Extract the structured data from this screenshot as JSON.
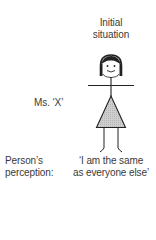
{
  "title": {
    "line1": "Initial",
    "line2": "situation"
  },
  "figure": {
    "name_label": "Ms. ‘X’",
    "icon": "stick-figure-woman-smiling",
    "dress_fill": "#c8c8c8",
    "stroke": "#222222"
  },
  "perception": {
    "label_line1": "Person’s",
    "label_line2": "perception:",
    "quote_line1": "‘I am the same",
    "quote_line2": "as everyone else’"
  }
}
